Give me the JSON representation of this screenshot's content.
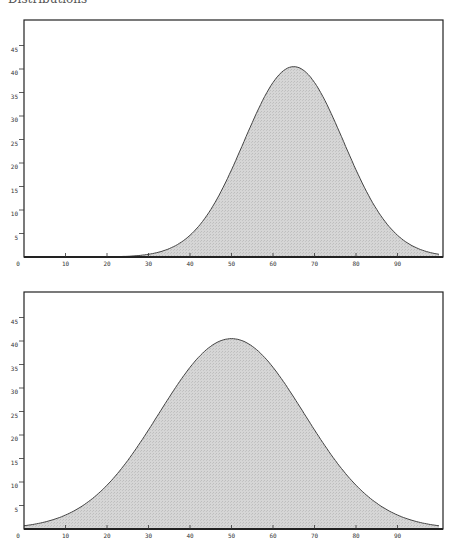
{
  "header": {
    "title_cut": "Distributions"
  },
  "style": {
    "fill_color": "#d3d3d3",
    "line_color": "#444444",
    "frame_color": "#222222",
    "background": "#ffffff"
  },
  "chart_data": [
    {
      "type": "area",
      "title": "",
      "xlabel": "",
      "ylabel": "",
      "xlim": [
        0,
        100
      ],
      "ylim": [
        0,
        48
      ],
      "xticks": [
        0,
        10,
        20,
        30,
        40,
        50,
        60,
        70,
        80,
        90
      ],
      "yticks": [
        5,
        10,
        15,
        20,
        25,
        30,
        35,
        40,
        45
      ],
      "grid": false,
      "legend": null,
      "distribution": {
        "kind": "normal",
        "mean": 65,
        "sd": 12,
        "peak": 40.5
      },
      "x": [
        0,
        10,
        15,
        20,
        25,
        30,
        35,
        40,
        45,
        50,
        55,
        60,
        65,
        70,
        75,
        80,
        85,
        90,
        95,
        100
      ],
      "values": [
        0.0,
        0.0,
        0.01,
        0.04,
        0.17,
        0.58,
        1.8,
        4.62,
        10.1,
        18.5,
        28.6,
        37.1,
        40.5,
        37.1,
        28.6,
        18.5,
        10.1,
        4.62,
        1.78,
        0.58
      ]
    },
    {
      "type": "area",
      "title": "",
      "xlabel": "",
      "ylabel": "",
      "xlim": [
        0,
        100
      ],
      "ylim": [
        0,
        48
      ],
      "xticks": [
        0,
        10,
        20,
        30,
        40,
        50,
        60,
        70,
        80,
        90
      ],
      "yticks": [
        5,
        10,
        15,
        20,
        25,
        30,
        35,
        40,
        45
      ],
      "grid": false,
      "legend": null,
      "distribution": {
        "kind": "normal",
        "mean": 50,
        "sd": 17.5,
        "peak": 40.5
      },
      "x": [
        0,
        5,
        10,
        15,
        20,
        25,
        30,
        35,
        40,
        45,
        50,
        55,
        60,
        65,
        70,
        75,
        80,
        85,
        90,
        95,
        100
      ],
      "values": [
        0.68,
        1.51,
        2.97,
        5.39,
        9.3,
        14.6,
        21.1,
        28.0,
        34.4,
        38.9,
        40.5,
        38.9,
        34.4,
        28.0,
        21.1,
        14.6,
        9.3,
        5.39,
        2.97,
        1.51,
        0.68
      ]
    }
  ],
  "layout": {
    "charts": [
      {
        "left": 24,
        "right": 443,
        "top": 20,
        "bottom": 257
      },
      {
        "left": 24,
        "right": 443,
        "top": 292,
        "bottom": 529
      }
    ],
    "px_per_x": 4.15,
    "px_per_y": 4.7
  }
}
